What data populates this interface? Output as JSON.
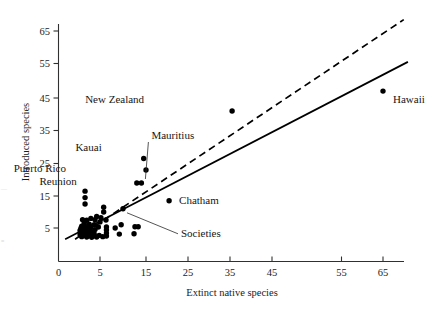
{
  "chart_data": {
    "type": "scatter",
    "title": "",
    "xlabel": "Extinct native species",
    "ylabel": "Introduced species",
    "xlim": [
      0,
      72
    ],
    "ylim": [
      0,
      70
    ],
    "xticks": [
      0,
      5,
      15,
      25,
      35,
      45,
      55,
      65
    ],
    "xticklabels": [
      "0",
      "5",
      "15",
      "25",
      "35",
      "45",
      "55",
      "65"
    ],
    "yticks": [
      5,
      15,
      25,
      35,
      45,
      55,
      65
    ],
    "yticklabels": [
      "5",
      "15",
      "25",
      "35",
      "45",
      "55",
      "65"
    ],
    "grid": false,
    "legend": null,
    "series": [
      {
        "name": "islands",
        "marker": "filled-circle",
        "color": "#000000",
        "points": [
          {
            "x": 65.0,
            "y": 47.0,
            "label": "Hawaii"
          },
          {
            "x": 35.5,
            "y": 41.0,
            "label": "New Zealand"
          },
          {
            "x": 14.5,
            "y": 26.5,
            "label": "Kauai"
          },
          {
            "x": 15.0,
            "y": 23.0,
            "label": "Puerto Rico"
          },
          {
            "x": 13.0,
            "y": 19.0,
            "label": "Reunion"
          },
          {
            "x": 14.0,
            "y": 19.0,
            "label": "Mauritius"
          },
          {
            "x": 20.5,
            "y": 13.5,
            "label": "Chatham"
          },
          {
            "x": 10.0,
            "y": 11.0,
            "label": "Societies"
          },
          {
            "x": 3.2,
            "y": 16.5,
            "label": ""
          },
          {
            "x": 3.2,
            "y": 14.5,
            "label": ""
          },
          {
            "x": 3.2,
            "y": 12.5,
            "label": ""
          },
          {
            "x": 5.8,
            "y": 11.5,
            "label": ""
          },
          {
            "x": 5.8,
            "y": 10.0,
            "label": ""
          },
          {
            "x": 4.6,
            "y": 8.6,
            "label": ""
          },
          {
            "x": 5.2,
            "y": 8.2,
            "label": ""
          },
          {
            "x": 3.9,
            "y": 8.0,
            "label": ""
          },
          {
            "x": 4.4,
            "y": 7.6,
            "label": ""
          },
          {
            "x": 3.4,
            "y": 7.4,
            "label": ""
          },
          {
            "x": 2.9,
            "y": 7.6,
            "label": ""
          },
          {
            "x": 6.3,
            "y": 7.5,
            "label": ""
          },
          {
            "x": 5.0,
            "y": 6.9,
            "label": ""
          },
          {
            "x": 3.1,
            "y": 6.4,
            "label": ""
          },
          {
            "x": 3.7,
            "y": 6.2,
            "label": ""
          },
          {
            "x": 4.3,
            "y": 6.0,
            "label": ""
          },
          {
            "x": 2.8,
            "y": 5.6,
            "label": ""
          },
          {
            "x": 3.3,
            "y": 5.4,
            "label": ""
          },
          {
            "x": 3.9,
            "y": 5.2,
            "label": ""
          },
          {
            "x": 4.8,
            "y": 5.3,
            "label": ""
          },
          {
            "x": 2.7,
            "y": 4.9,
            "label": ""
          },
          {
            "x": 3.2,
            "y": 4.7,
            "label": ""
          },
          {
            "x": 3.8,
            "y": 4.6,
            "label": ""
          },
          {
            "x": 4.4,
            "y": 4.5,
            "label": ""
          },
          {
            "x": 2.6,
            "y": 4.2,
            "label": ""
          },
          {
            "x": 3.1,
            "y": 4.0,
            "label": ""
          },
          {
            "x": 3.6,
            "y": 3.9,
            "label": ""
          },
          {
            "x": 4.2,
            "y": 3.8,
            "label": ""
          },
          {
            "x": 2.7,
            "y": 3.5,
            "label": ""
          },
          {
            "x": 3.2,
            "y": 3.4,
            "label": ""
          },
          {
            "x": 3.7,
            "y": 3.3,
            "label": ""
          },
          {
            "x": 4.3,
            "y": 3.2,
            "label": ""
          },
          {
            "x": 2.6,
            "y": 2.9,
            "label": ""
          },
          {
            "x": 3.1,
            "y": 2.8,
            "label": ""
          },
          {
            "x": 3.6,
            "y": 2.7,
            "label": ""
          },
          {
            "x": 4.2,
            "y": 2.6,
            "label": ""
          },
          {
            "x": 4.9,
            "y": 2.7,
            "label": ""
          },
          {
            "x": 2.8,
            "y": 2.3,
            "label": ""
          },
          {
            "x": 3.4,
            "y": 2.2,
            "label": ""
          },
          {
            "x": 4.0,
            "y": 2.1,
            "label": ""
          },
          {
            "x": 4.6,
            "y": 2.2,
            "label": ""
          },
          {
            "x": 5.6,
            "y": 2.3,
            "label": ""
          },
          {
            "x": 6.4,
            "y": 5.3,
            "label": ""
          },
          {
            "x": 6.4,
            "y": 4.4,
            "label": ""
          },
          {
            "x": 6.4,
            "y": 3.4,
            "label": ""
          },
          {
            "x": 6.4,
            "y": 2.5,
            "label": ""
          },
          {
            "x": 8.3,
            "y": 5.0,
            "label": ""
          },
          {
            "x": 9.6,
            "y": 6.0,
            "label": ""
          },
          {
            "x": 9.2,
            "y": 3.1,
            "label": ""
          },
          {
            "x": 12.6,
            "y": 5.4,
            "label": ""
          },
          {
            "x": 13.3,
            "y": 5.4,
            "label": ""
          },
          {
            "x": 12.4,
            "y": 3.2,
            "label": ""
          }
        ]
      }
    ],
    "lines": [
      {
        "name": "regression-line",
        "style": "solid",
        "color": "#000000",
        "from": {
          "x": 0.8,
          "y": 1.5
        },
        "to": {
          "x": 71.0,
          "y": 55.5
        }
      },
      {
        "name": "reference-line",
        "style": "dashed",
        "color": "#000000",
        "from": {
          "x": 2.0,
          "y": 1.5
        },
        "to": {
          "x": 70.0,
          "y": 68.5
        }
      }
    ],
    "annotations": [
      {
        "name": "hawaii",
        "text": "Hawaii",
        "x": 65.0,
        "y": 47.0,
        "label_dx": 10,
        "label_dy": 12,
        "leader": false
      },
      {
        "name": "new-zealand",
        "text": "New Zealand",
        "x": 35.5,
        "y": 41.0,
        "label_dx": -88,
        "label_dy": -8,
        "leader": false
      },
      {
        "name": "kauai",
        "text": "Kauai",
        "x": 14.5,
        "y": 26.5,
        "label_dx": -42,
        "label_dy": -8,
        "leader": false
      },
      {
        "name": "mauritius",
        "text": "Mauritius",
        "x": 14.0,
        "y": 19.0,
        "label_dx": 10,
        "label_dy": -44,
        "leader": true
      },
      {
        "name": "puerto-rico",
        "text": "Puerto Rico",
        "x": 15.0,
        "y": 23.0,
        "label_dx": -80,
        "label_dy": 2,
        "leader": false
      },
      {
        "name": "reunion",
        "text": "Reunion",
        "x": 13.0,
        "y": 19.0,
        "label_dx": -60,
        "label_dy": 2,
        "leader": false
      },
      {
        "name": "chatham",
        "text": "Chatham",
        "x": 20.5,
        "y": 13.5,
        "label_dx": 10,
        "label_dy": 3,
        "leader": false
      },
      {
        "name": "societies",
        "text": "Societies",
        "x": 10.0,
        "y": 11.0,
        "label_dx": 58,
        "label_dy": 28,
        "leader": true
      }
    ]
  },
  "axes": {
    "x_title": "Extinct native species",
    "y_title": "Introduced species"
  },
  "labels": {
    "hawaii": "Hawaii",
    "new_zealand": "New Zealand",
    "kauai": "Kauai",
    "mauritius": "Mauritius",
    "puerto_rico": "Puerto Rico",
    "reunion": "Reunion",
    "chatham": "Chatham",
    "societies": "Societies"
  },
  "xtick_labels": [
    "0",
    "5",
    "15",
    "25",
    "35",
    "45",
    "55",
    "65"
  ],
  "ytick_labels": [
    "5",
    "15",
    "25",
    "35",
    "45",
    "55",
    "65"
  ],
  "colors": {
    "marker": "#000000",
    "axis": "#303030",
    "text": "#1b1b1b"
  }
}
